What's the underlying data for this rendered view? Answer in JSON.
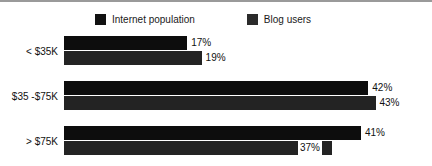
{
  "chart_data": {
    "type": "bar",
    "orientation": "horizontal",
    "title": "",
    "xlabel": "",
    "ylabel": "",
    "categories": [
      "< $35K",
      "$35 -$75K",
      "> $75K"
    ],
    "series": [
      {
        "name": "Internet population",
        "color": "#0d0d0d",
        "values": [
          17,
          42,
          41
        ],
        "labels": [
          "17%",
          "42%",
          "41%"
        ]
      },
      {
        "name": "Blog users",
        "color": "#232323",
        "values": [
          19,
          43,
          37
        ],
        "labels": [
          "19%",
          "43%",
          "37%"
        ]
      }
    ],
    "value_suffix": "%",
    "xlim": [
      0,
      45
    ],
    "grid": false,
    "legend_position": "top"
  },
  "legend": {
    "entries": [
      {
        "label": "Internet population",
        "swatch": "legend-swatch-internet-population"
      },
      {
        "label": "Blog users",
        "swatch": "legend-swatch-blog-users"
      }
    ]
  },
  "colors": {
    "series_internet_population": "#0d0d0d",
    "series_blog_users": "#232323",
    "background": "#ffffff",
    "text": "#111111",
    "top_rule": "#9a9a9a"
  }
}
